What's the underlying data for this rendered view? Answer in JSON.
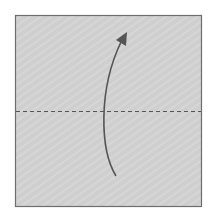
{
  "diagram": {
    "type": "origami-fold-step",
    "paper": {
      "x": 15,
      "y": 15,
      "width": 187,
      "height": 192,
      "fill": "#cfcfcf",
      "stroke": "#6e6e6e"
    },
    "fold_line": {
      "style": "valley-dashed",
      "y": 111,
      "color": "#555555"
    },
    "arrow": {
      "direction": "up",
      "meaning": "fold bottom half up",
      "color": "#555555"
    }
  }
}
